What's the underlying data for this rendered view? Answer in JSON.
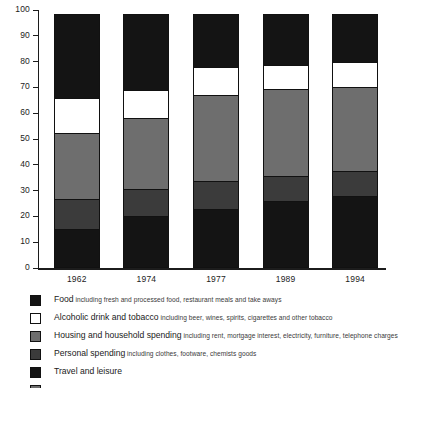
{
  "chart_data": {
    "type": "bar",
    "stacked": true,
    "title": "",
    "subtitle": "",
    "xlabel": "",
    "ylabel": "",
    "ylim": [
      0,
      100
    ],
    "yticks": [
      0,
      10,
      20,
      30,
      40,
      50,
      60,
      70,
      80,
      90,
      100
    ],
    "ytick_labels": [
      "0",
      "10",
      "20",
      "30",
      "40",
      "50",
      "60",
      "70",
      "80",
      "90",
      "100"
    ],
    "grid": false,
    "legend_position": "below",
    "categories": [
      "1962",
      "1974",
      "1977",
      "1989",
      "1994"
    ],
    "series": [
      {
        "name": "Food",
        "color": "#141414",
        "values": [
          15,
          20,
          23,
          26,
          28
        ]
      },
      {
        "name": "Personal spending",
        "color": "#3b3b3b",
        "values": [
          12,
          11,
          11,
          10,
          10
        ]
      },
      {
        "name": "Housing and household spending",
        "color": "#6e6e6e",
        "values": [
          26,
          28,
          34,
          34,
          33
        ]
      },
      {
        "name": "Alcoholic drink and tobacco",
        "color": "#ffffff",
        "values": [
          14,
          11,
          11,
          10,
          10
        ]
      },
      {
        "name": "Travel and leisure",
        "color": "#141414",
        "values": [
          33,
          30,
          21,
          20,
          19
        ]
      }
    ]
  },
  "legend": {
    "items": [
      {
        "swatch": "#141414",
        "title": "Food",
        "desc": "including fresh and processed food, restaurant meals and take aways",
        "clipped": false
      },
      {
        "swatch": "#ffffff",
        "title": "Alcoholic drink and tobacco",
        "desc": "including beer, wines, spirits, cigarettes and other tobacco",
        "clipped": false
      },
      {
        "swatch": "#6e6e6e",
        "title": "Housing and household spending",
        "desc": "including rent, mortgage interest, electricity, furniture, telephone charges",
        "clipped": false
      },
      {
        "swatch": "#3b3b3b",
        "title": "Personal spending",
        "desc": "including clothes, footware, chemists goods",
        "clipped": false
      },
      {
        "swatch": "#141414",
        "title": "Travel and leisure",
        "desc": "",
        "clipped": false
      },
      {
        "swatch": "#6e6e6e",
        "title": "",
        "desc": "",
        "clipped": true
      }
    ]
  }
}
